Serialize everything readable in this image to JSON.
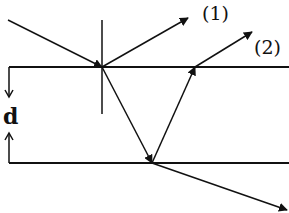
{
  "diagram": {
    "type": "thin-film-interference",
    "labels": {
      "ray1": "(1)",
      "ray2": "(2)",
      "thickness": "d"
    },
    "colors": {
      "line": "#111111",
      "background": "#ffffff"
    }
  }
}
